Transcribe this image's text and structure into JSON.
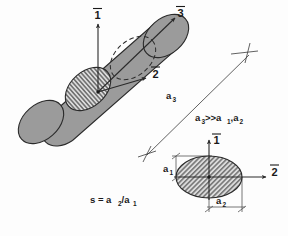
{
  "figure": {
    "title": "",
    "type": "technical-diagram",
    "background_color": "#fdfdfd",
    "body_fill": "#9a9a9a",
    "body_stroke": "#2b2b2b",
    "hatch_fill": "#d8d8d8",
    "hatch_line": "#333333"
  },
  "cylinder": {
    "name": "fiber-cylinder",
    "axes": [
      {
        "id": "axis-1",
        "label": "1",
        "overbar": true
      },
      {
        "id": "axis-2",
        "label": "2",
        "overbar": true
      },
      {
        "id": "axis-3",
        "label": "3",
        "overbar": true
      }
    ],
    "cross_section_hatch": "vertical",
    "far_end": "dashed-ellipse",
    "near_end": "solid-ellipse"
  },
  "dimension": {
    "name": "a3-length",
    "label": "a",
    "sub": "3",
    "marker": "cross"
  },
  "relations": {
    "inequality": {
      "text": "a",
      "sub1": "3",
      "op": ">>a",
      "sub2": "1",
      "comma": ",a",
      "sub3": "2",
      "full": "a3>>a1,a2"
    },
    "shape_factor": {
      "lhs": "s = a",
      "sub_num": "2",
      "slash": "/a",
      "sub_den": "1",
      "full": "s = a2/a1"
    }
  },
  "cross_section": {
    "name": "ellipse-cross-section",
    "hatch": "diagonal",
    "axes": [
      {
        "id": "cs-axis-1",
        "label": "1",
        "overbar": true
      },
      {
        "id": "cs-axis-2",
        "label": "2",
        "overbar": true
      }
    ],
    "dims": [
      {
        "id": "dim-a1",
        "label": "a",
        "sub": "1",
        "orientation": "vertical"
      },
      {
        "id": "dim-a2",
        "label": "a",
        "sub": "2",
        "orientation": "horizontal"
      }
    ]
  }
}
